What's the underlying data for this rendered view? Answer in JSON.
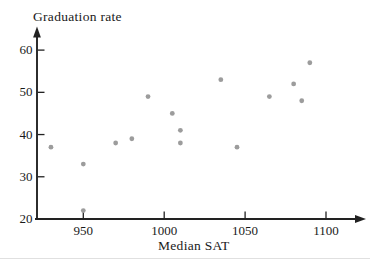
{
  "chart_data": {
    "type": "scatter",
    "title": "Graduation rate",
    "xlabel": "Median SAT",
    "ylabel": "Graduation rate",
    "x_ticks": [
      950,
      1000,
      1050,
      1100
    ],
    "y_ticks": [
      20,
      30,
      40,
      50,
      60
    ],
    "xlim": [
      921,
      1125
    ],
    "ylim": [
      20,
      65
    ],
    "grid": false,
    "legend": null,
    "point_color": "#9c9c9c",
    "axis_color": "#222222",
    "text_color": "#1a1a1a",
    "points": [
      {
        "x": 930,
        "y": 37
      },
      {
        "x": 950,
        "y": 33
      },
      {
        "x": 950,
        "y": 22
      },
      {
        "x": 970,
        "y": 38
      },
      {
        "x": 980,
        "y": 39
      },
      {
        "x": 990,
        "y": 49
      },
      {
        "x": 1005,
        "y": 45
      },
      {
        "x": 1010,
        "y": 41
      },
      {
        "x": 1010,
        "y": 38
      },
      {
        "x": 1035,
        "y": 53
      },
      {
        "x": 1045,
        "y": 37
      },
      {
        "x": 1065,
        "y": 49
      },
      {
        "x": 1080,
        "y": 52
      },
      {
        "x": 1085,
        "y": 48
      },
      {
        "x": 1090,
        "y": 57
      }
    ]
  }
}
